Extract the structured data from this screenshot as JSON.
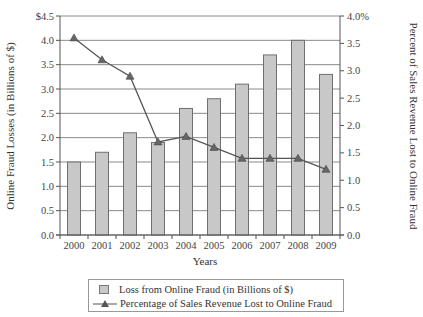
{
  "chart_data": {
    "type": "bar+line",
    "categories": [
      "2000",
      "2001",
      "2002",
      "2003",
      "2004",
      "2005",
      "2006",
      "2007",
      "2008",
      "2009"
    ],
    "series": [
      {
        "name": "Loss from Online Fraud (in Billions of $)",
        "type": "bar",
        "axis": "left",
        "color": "#c8c8c8",
        "values": [
          1.5,
          1.7,
          2.1,
          1.9,
          2.6,
          2.8,
          3.1,
          3.7,
          4.0,
          3.3
        ]
      },
      {
        "name": "Percentage of Sales Revenue Lost to Online Fraud",
        "type": "line",
        "axis": "right",
        "color": "#555555",
        "marker": "triangle",
        "values": [
          3.6,
          3.2,
          2.9,
          1.7,
          1.8,
          1.6,
          1.4,
          1.4,
          1.4,
          1.2
        ]
      }
    ],
    "title": "",
    "xlabel": "Years",
    "ylabel": "Online Fraud Losses (in Billions of $)",
    "y2label": "Percent of Sales Revenue Lost to Online Fraud",
    "ylim": [
      0,
      4.5
    ],
    "y2lim": [
      0,
      4.0
    ],
    "yticks": [
      "$4.5",
      "4.0",
      "3.5",
      "3.0",
      "2.5",
      "2.0",
      "1.5",
      "1.0",
      "0.5",
      "0.0"
    ],
    "y2ticks": [
      "4.0%",
      "3.5",
      "3.0",
      "2.5",
      "2.0",
      "1.5",
      "1.0",
      "0.5",
      "0.0"
    ],
    "grid": true,
    "legend_position": "bottom"
  },
  "legend": {
    "bar_label": "Loss from Online Fraud (in Billions of $)",
    "line_label": "Percentage of Sales Revenue Lost to Online Fraud"
  }
}
